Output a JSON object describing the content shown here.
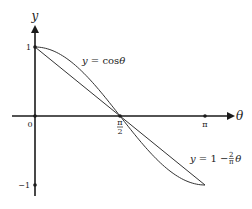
{
  "chart_data": {
    "type": "line",
    "title": "",
    "xlabel": "θ",
    "ylabel": "y",
    "xlim": [
      -0.85,
      3.95
    ],
    "ylim": [
      -1.2,
      1.5
    ],
    "x_ticks": [
      {
        "value": 0,
        "label": "0"
      },
      {
        "value": 1.5707963,
        "label": "π/2",
        "num": "π",
        "den": "2"
      },
      {
        "value": 3.1415927,
        "label": "π"
      }
    ],
    "y_ticks": [
      {
        "value": 1,
        "label": "1"
      },
      {
        "value": -1,
        "label": "−1"
      }
    ],
    "series": [
      {
        "name": "y = cosθ",
        "function": "cos",
        "domain": [
          0,
          3.1415927
        ]
      },
      {
        "name": "y = 1 − (2/π)θ",
        "function": "linear",
        "domain": [
          0,
          3.1415927
        ]
      }
    ],
    "annotations": {
      "cos_label": {
        "prefix": "y",
        "eq": " = cos",
        "var": "θ"
      },
      "line_label": {
        "prefix": "y",
        "eq": " = 1 − ",
        "num": "2",
        "den": "π",
        "var": "θ"
      }
    },
    "grid": false,
    "legend": "none"
  }
}
